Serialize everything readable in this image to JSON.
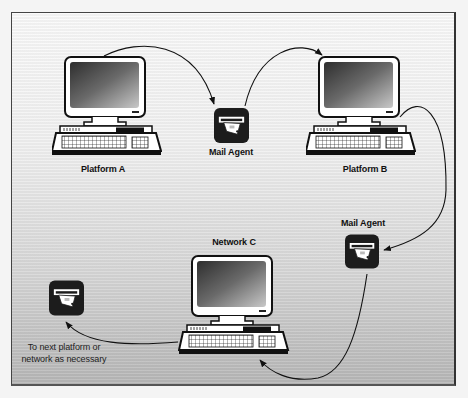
{
  "diagram": {
    "type": "mail-routing-flow",
    "nodes": {
      "platform_a": {
        "label": "Platform A",
        "icon": "computer-workstation-icon"
      },
      "mail_agent_1": {
        "label": "Mail Agent",
        "icon": "mail-agent-icon"
      },
      "platform_b": {
        "label": "Platform B",
        "icon": "computer-workstation-icon"
      },
      "mail_agent_2": {
        "label": "Mail Agent",
        "icon": "mail-agent-icon"
      },
      "network_c": {
        "label": "Network C",
        "icon": "computer-workstation-icon"
      },
      "next_hop": {
        "label": "To next platform or network as necessary",
        "icon": "mail-agent-icon"
      }
    },
    "edges": [
      {
        "from": "Platform A",
        "to": "Mail Agent"
      },
      {
        "from": "Mail Agent",
        "to": "Platform B"
      },
      {
        "from": "Platform B",
        "to": "Mail Agent"
      },
      {
        "from": "Mail Agent",
        "to": "Network C"
      },
      {
        "from": "Network C",
        "to": "To next platform or network as necessary"
      }
    ],
    "colors": {
      "line": "#1a1a1a",
      "agent_box": "#1c1c1c",
      "screen_dark": "#3a3a3a",
      "screen_light": "#bdbdbd"
    }
  }
}
